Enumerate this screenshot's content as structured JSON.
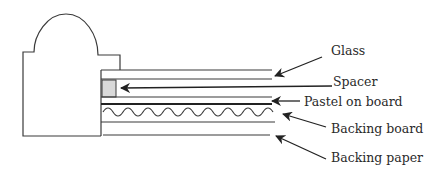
{
  "diagram": {
    "labels": [
      {
        "id": "glass",
        "text": "Glass"
      },
      {
        "id": "spacer",
        "text": "Spacer"
      },
      {
        "id": "pastel",
        "text": "Pastel on board"
      },
      {
        "id": "backing-board",
        "text": "Backing board"
      },
      {
        "id": "backing-paper",
        "text": "Backing paper"
      }
    ],
    "colors": {
      "line": "#3a3a3a",
      "spacer_fill": "#d9d9d9",
      "background": "#ffffff"
    }
  }
}
